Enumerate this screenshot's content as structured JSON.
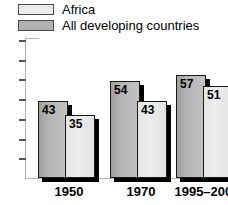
{
  "legend": {
    "items": [
      {
        "label": "Africa",
        "color": "#ebebeb"
      },
      {
        "label": "All developing countries",
        "color": "#b0b0b0"
      }
    ]
  },
  "axis": {
    "tick_count": 7,
    "tick_labels": []
  },
  "chart_data": {
    "type": "bar",
    "title": "",
    "xlabel": "",
    "ylabel": "",
    "ylim": [
      0,
      70
    ],
    "grid": false,
    "legend_position": "top-left",
    "categories": [
      "1950",
      "1970",
      "1995–2000"
    ],
    "series": [
      {
        "name": "All developing countries",
        "color": "#b0b0b0",
        "values": [
          43,
          54,
          57
        ]
      },
      {
        "name": "Africa",
        "color": "#ebebeb",
        "values": [
          35,
          43,
          51
        ]
      }
    ]
  }
}
